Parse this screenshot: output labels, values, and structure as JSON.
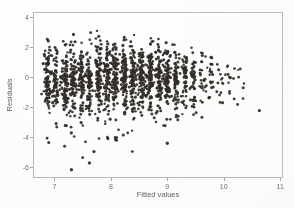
{
  "chart_data": {
    "type": "scatter",
    "title": "",
    "xlabel": "Fitted values",
    "ylabel": "Residuals",
    "xlim": [
      6.62,
      11.05
    ],
    "ylim": [
      -6.7,
      4.3
    ],
    "xticks": [
      7,
      8,
      9,
      10,
      11
    ],
    "xtick_labels": [
      "7",
      "8",
      "9",
      "10",
      "11"
    ],
    "yticks": [
      4,
      2,
      0,
      -2,
      -4,
      -6
    ],
    "ytick_labels": [
      "4",
      "2",
      "0",
      "-2",
      "-4",
      "-6"
    ],
    "grid": false,
    "legend": "none",
    "marker": {
      "shape": "circle",
      "color": "#2d2a27",
      "size_px": 2.5,
      "opacity": 0.93
    },
    "n_points": 1850,
    "clusters": [
      {
        "x": 6.88,
        "n": 95,
        "y_center": -0.15,
        "y_spread": 1.15,
        "y_min": -4.3,
        "y_max": 2.55
      },
      {
        "x": 7.02,
        "n": 70,
        "y_center": -0.1,
        "y_spread": 1.1,
        "y_min": -3.4,
        "y_max": 2.1
      },
      {
        "x": 7.18,
        "n": 88,
        "y_center": -0.12,
        "y_spread": 1.18,
        "y_min": -4.6,
        "y_max": 2.4
      },
      {
        "x": 7.33,
        "n": 92,
        "y_center": -0.08,
        "y_spread": 1.2,
        "y_min": -6.1,
        "y_max": 3.05
      },
      {
        "x": 7.48,
        "n": 80,
        "y_center": -0.05,
        "y_spread": 1.15,
        "y_min": -5.4,
        "y_max": 2.85
      },
      {
        "x": 7.62,
        "n": 86,
        "y_center": -0.06,
        "y_spread": 1.18,
        "y_min": -5.7,
        "y_max": 3.2
      },
      {
        "x": 7.78,
        "n": 96,
        "y_center": -0.02,
        "y_spread": 1.2,
        "y_min": -4.5,
        "y_max": 3.3
      },
      {
        "x": 7.93,
        "n": 102,
        "y_center": 0.0,
        "y_spread": 1.16,
        "y_min": -4.1,
        "y_max": 2.95
      },
      {
        "x": 8.08,
        "n": 98,
        "y_center": -0.02,
        "y_spread": 1.14,
        "y_min": -4.2,
        "y_max": 3.05
      },
      {
        "x": 8.24,
        "n": 104,
        "y_center": 0.02,
        "y_spread": 1.12,
        "y_min": -3.9,
        "y_max": 2.8
      },
      {
        "x": 8.39,
        "n": 99,
        "y_center": 0.01,
        "y_spread": 1.13,
        "y_min": -5.0,
        "y_max": 3.15
      },
      {
        "x": 8.54,
        "n": 95,
        "y_center": 0.0,
        "y_spread": 1.1,
        "y_min": -3.6,
        "y_max": 2.7
      },
      {
        "x": 8.7,
        "n": 100,
        "y_center": 0.03,
        "y_spread": 1.08,
        "y_min": -3.5,
        "y_max": 2.85
      },
      {
        "x": 8.85,
        "n": 92,
        "y_center": 0.02,
        "y_spread": 1.05,
        "y_min": -3.4,
        "y_max": 2.6
      },
      {
        "x": 9.0,
        "n": 86,
        "y_center": -0.02,
        "y_spread": 1.06,
        "y_min": -4.4,
        "y_max": 2.55
      },
      {
        "x": 9.16,
        "n": 74,
        "y_center": -0.05,
        "y_spread": 1.0,
        "y_min": -2.9,
        "y_max": 2.4
      },
      {
        "x": 9.31,
        "n": 58,
        "y_center": -0.08,
        "y_spread": 0.98,
        "y_min": -2.8,
        "y_max": 2.2
      },
      {
        "x": 9.46,
        "n": 46,
        "y_center": -0.12,
        "y_spread": 0.95,
        "y_min": -2.6,
        "y_max": 2.15
      },
      {
        "x": 9.62,
        "n": 26,
        "y_center": -0.18,
        "y_spread": 0.9,
        "y_min": -3.2,
        "y_max": 1.6
      },
      {
        "x": 9.78,
        "n": 18,
        "y_center": -0.25,
        "y_spread": 0.88,
        "y_min": -2.4,
        "y_max": 1.35
      },
      {
        "x": 9.93,
        "n": 13,
        "y_center": -0.3,
        "y_spread": 0.85,
        "y_min": -2.2,
        "y_max": 1.3
      },
      {
        "x": 10.08,
        "n": 9,
        "y_center": -0.35,
        "y_spread": 0.8,
        "y_min": -2.0,
        "y_max": 0.95
      },
      {
        "x": 10.22,
        "n": 7,
        "y_center": -0.45,
        "y_spread": 0.75,
        "y_min": -1.9,
        "y_max": 0.55
      },
      {
        "x": 10.38,
        "n": 3,
        "y_center": -0.7,
        "y_spread": 0.6,
        "y_min": -1.6,
        "y_max": 0.1
      },
      {
        "x": 10.56,
        "n": 1,
        "y_center": -1.85,
        "y_spread": 0.1,
        "y_min": -1.9,
        "y_max": -1.8
      }
    ],
    "outliers": [
      {
        "x": 7.3,
        "y": -6.15
      },
      {
        "x": 7.62,
        "y": -5.7
      },
      {
        "x": 7.5,
        "y": -5.35
      },
      {
        "x": 7.7,
        "y": -4.95
      },
      {
        "x": 8.38,
        "y": -4.95
      },
      {
        "x": 6.9,
        "y": -4.35
      },
      {
        "x": 7.18,
        "y": -4.6
      },
      {
        "x": 7.55,
        "y": -4.3
      },
      {
        "x": 7.95,
        "y": -4.1
      },
      {
        "x": 8.1,
        "y": -4.2
      },
      {
        "x": 9.0,
        "y": -4.4
      },
      {
        "x": 7.35,
        "y": -3.95
      },
      {
        "x": 8.22,
        "y": -3.85
      }
    ]
  },
  "axes": {
    "x_title": "Fitted values",
    "y_title": "Residuals"
  }
}
